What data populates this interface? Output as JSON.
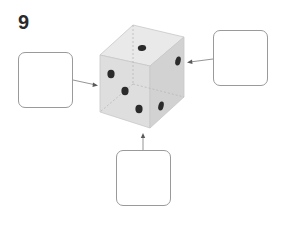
{
  "question": {
    "number": "9"
  },
  "die": {
    "top_face_pips": 1,
    "front_face_pips": 3,
    "right_face_pips": 2,
    "colors": {
      "top": "#e9e9e9",
      "front": "#dcdcdc",
      "right": "#cfcfcf",
      "pip": "#2b2b2b",
      "edge": "#c4c4c4"
    }
  },
  "answer_boxes": [
    {
      "id": "left",
      "points_to": "hidden-left-face",
      "value": ""
    },
    {
      "id": "right",
      "points_to": "hidden-back-face",
      "value": ""
    },
    {
      "id": "bottom",
      "points_to": "hidden-bottom-face",
      "value": ""
    }
  ]
}
